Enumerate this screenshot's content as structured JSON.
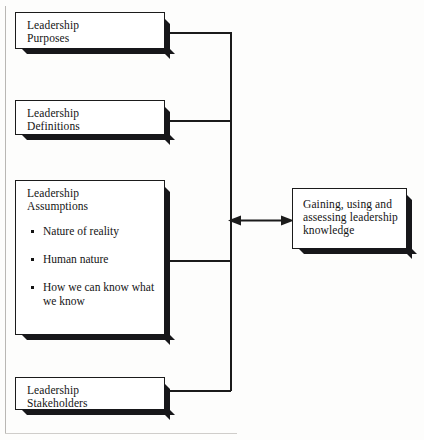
{
  "diagram": {
    "ink_color": "#1b1b1b",
    "paper_color": "#fdfdfc",
    "shadow_color": "#17171a",
    "left_nodes": [
      {
        "id": "purposes",
        "lines": [
          "Leadership",
          "Purposes"
        ],
        "bullets": []
      },
      {
        "id": "definitions",
        "lines": [
          "Leadership",
          "Definitions"
        ],
        "bullets": []
      },
      {
        "id": "assumptions",
        "lines": [
          "Leadership",
          "Assumptions"
        ],
        "bullets": [
          {
            "lines": [
              "Nature of reality"
            ]
          },
          {
            "lines": [
              "Human nature"
            ]
          },
          {
            "lines": [
              "How we can know what",
              "we know"
            ]
          }
        ]
      },
      {
        "id": "stakeholders",
        "lines": [
          "Leadership",
          "Stakeholders"
        ],
        "bullets": []
      }
    ],
    "right_node": {
      "id": "knowledge",
      "lines": [
        "Gaining, using and",
        "assessing leadership",
        "knowledge"
      ]
    },
    "connector": {
      "type": "double-headed-arrow",
      "direction": "bidirectional",
      "bus": "vertical-spine"
    }
  }
}
